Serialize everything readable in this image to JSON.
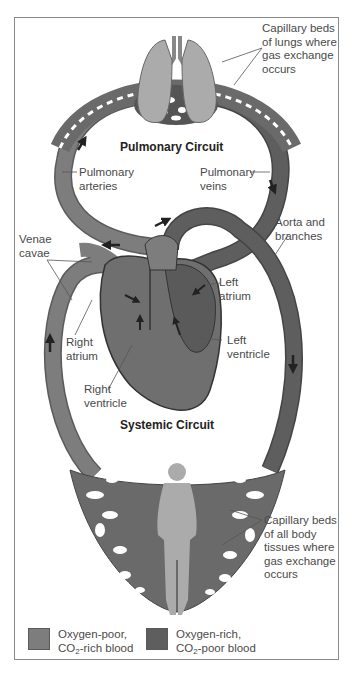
{
  "figure": {
    "circuits": {
      "pulmonary_title": "Pulmonary Circuit",
      "systemic_title": "Systemic Circuit"
    },
    "labels": {
      "lung_capillaries": "Capillary beds\nof lungs where\ngas exchange\noccurs",
      "pulmonary_arteries": "Pulmonary\narteries",
      "pulmonary_veins": "Pulmonary\nveins",
      "aorta": "Aorta and\nbranches",
      "venae_cavae": "Venae\ncavae",
      "left_atrium": "Left\natrium",
      "right_atrium": "Right\natrium",
      "left_ventricle": "Left\nventricle",
      "right_ventricle": "Right\nventricle",
      "body_capillaries": "Capillary beds\nof all body\ntissues where\ngas exchange\noccurs"
    },
    "legend": [
      {
        "label_line1": "Oxygen-poor,",
        "label_line2_pre": "CO",
        "label_line2_sub": "2",
        "label_line2_post": "-rich blood",
        "color": "#7d7d7d"
      },
      {
        "label_line1": "Oxygen-rich,",
        "label_line2_pre": "CO",
        "label_line2_sub": "2",
        "label_line2_post": "-poor blood",
        "color": "#5e5e5e"
      }
    ],
    "colors": {
      "oxygen_poor": "#7d7d7d",
      "oxygen_rich": "#5e5e5e",
      "organ_fill": "#aaaaaa",
      "frame_border": "#8a8a8a"
    }
  }
}
